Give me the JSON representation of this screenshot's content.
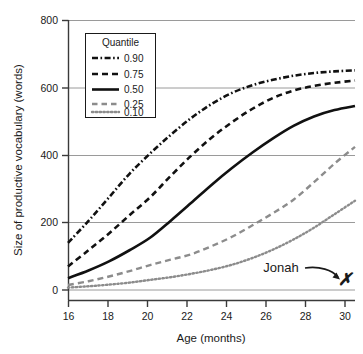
{
  "chart_data": {
    "type": "line",
    "title": "",
    "xlabel": "Age (months)",
    "ylabel": "Size of productive vocabulary (words)",
    "xlim": [
      15.2,
      30.0
    ],
    "ylim": [
      -45,
      800
    ],
    "xticks": [
      16,
      18,
      20,
      22,
      24,
      26,
      28,
      30
    ],
    "yticks": [
      0,
      200,
      400,
      600,
      800
    ],
    "xtick_labels": [
      "16",
      "18",
      "20",
      "22",
      "24",
      "26",
      "28",
      "30"
    ],
    "ytick_labels": [
      "0",
      "200",
      "400",
      "600",
      "800"
    ],
    "grid": "horizontal",
    "legend_position": "upper-left-inside",
    "legend_title": "Quantile",
    "x": [
      16,
      17,
      18,
      19,
      20,
      21,
      22,
      23,
      24,
      25,
      26,
      27,
      28,
      29,
      30
    ],
    "series": [
      {
        "name": "0.90",
        "label": "0.90",
        "style": "dash-dot",
        "color": "#111111",
        "width": 2.6,
        "values": [
          140,
          205,
          275,
          345,
          405,
          460,
          510,
          552,
          585,
          608,
          624,
          636,
          644,
          649,
          652
        ]
      },
      {
        "name": "0.75",
        "label": "0.75",
        "style": "dashed",
        "color": "#111111",
        "width": 2.6,
        "values": [
          70,
          118,
          168,
          222,
          275,
          338,
          398,
          452,
          498,
          538,
          570,
          592,
          606,
          615,
          622
        ]
      },
      {
        "name": "0.50",
        "label": "0.50",
        "style": "solid",
        "color": "#111111",
        "width": 2.6,
        "values": [
          35,
          58,
          85,
          118,
          155,
          205,
          258,
          312,
          362,
          408,
          450,
          487,
          515,
          534,
          546
        ]
      },
      {
        "name": "0.25",
        "label": "0.25",
        "style": "dashed",
        "color": "#8c8c8c",
        "width": 2.4,
        "values": [
          15,
          26,
          40,
          56,
          74,
          90,
          106,
          130,
          158,
          192,
          228,
          268,
          320,
          375,
          425
        ]
      },
      {
        "name": "0.10",
        "label": "0.10",
        "style": "dotted",
        "color": "#8c8c8c",
        "width": 2.4,
        "values": [
          7,
          11,
          16,
          22,
          30,
          38,
          48,
          60,
          75,
          95,
          120,
          150,
          185,
          225,
          265
        ]
      }
    ],
    "annotations": [
      {
        "name": "jonah",
        "label": "Jonah",
        "marker": "✗",
        "marker_x": 30,
        "marker_y": 38,
        "description": "curved arrow from label to marker"
      }
    ]
  },
  "legend": {
    "title": "Quantile",
    "entries": [
      {
        "label": "0.90"
      },
      {
        "label": "0.75"
      },
      {
        "label": "0.50"
      },
      {
        "label": "0.25"
      },
      {
        "label": "0.10"
      }
    ]
  },
  "axes": {
    "x_title": "Age (months)",
    "y_title": "Size of productive vocabulary (words)",
    "x_labels": [
      "16",
      "18",
      "20",
      "22",
      "24",
      "26",
      "28",
      "30"
    ],
    "y_labels": [
      "800",
      "600",
      "400",
      "200",
      "0"
    ]
  },
  "annotation": {
    "label": "Jonah",
    "marker": "✗"
  },
  "colors": {
    "ink": "#111111",
    "gray_series": "#8c8c8c",
    "gridline": "#9a9a9a",
    "axis": "#3a3a3a",
    "background": "#ffffff"
  }
}
